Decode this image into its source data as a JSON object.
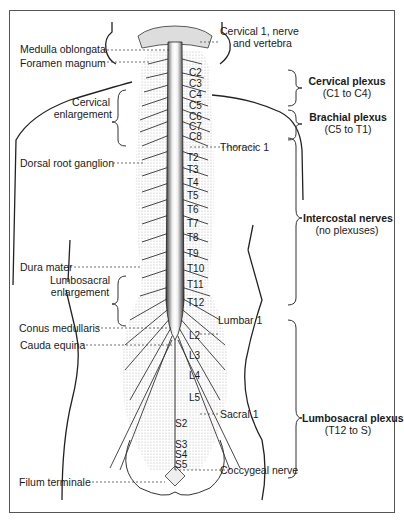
{
  "diagram": {
    "left_labels": [
      {
        "id": "medulla",
        "text": "Medulla oblongata"
      },
      {
        "id": "foramen",
        "text": "Foramen magnum"
      },
      {
        "id": "cervical_enl_1",
        "text": "Cervical"
      },
      {
        "id": "cervical_enl_2",
        "text": "enlargement"
      },
      {
        "id": "drg",
        "text": "Dorsal root ganglion"
      },
      {
        "id": "dura",
        "text": "Dura mater"
      },
      {
        "id": "lumbo_enl_1",
        "text": "Lumbosacral"
      },
      {
        "id": "lumbo_enl_2",
        "text": "enlargement"
      },
      {
        "id": "conus",
        "text": "Conus medullaris"
      },
      {
        "id": "cauda",
        "text": "Cauda equina"
      },
      {
        "id": "filum",
        "text": "Filum terminale"
      }
    ],
    "right_labels": {
      "cervical1_line1": "Cervical 1, nerve",
      "cervical1_line2": "and vertebra",
      "thoracic1": "Thoracic 1",
      "lumbar1": "Lumbar 1",
      "sacral1": "Sacral 1",
      "coccygeal": "Coccygeal nerve"
    },
    "plexuses": [
      {
        "name": "Cervical plexus",
        "range": "(C1 to C4)"
      },
      {
        "name": "Brachial plexus",
        "range": "(C5 to T1)"
      },
      {
        "name": "Intercostal nerves",
        "range": "(no plexuses)"
      },
      {
        "name": "Lumbosacral plexus",
        "range": "(T12 to S)"
      }
    ],
    "levels": {
      "cervical": [
        "C2",
        "C3",
        "C4",
        "C5",
        "C6",
        "C7",
        "C8"
      ],
      "thoracic": [
        "T2",
        "T3",
        "T4",
        "T5",
        "T6",
        "T7",
        "T8",
        "T9",
        "T10",
        "T11",
        "T12"
      ],
      "lumbar": [
        "L2",
        "L3",
        "L4",
        "L5"
      ],
      "sacral": [
        "S2",
        "S3",
        "S4",
        "S5"
      ]
    },
    "colors": {
      "ink": "#1a1a1a",
      "stipple": "#8a8a8a",
      "background": "#ffffff"
    }
  }
}
